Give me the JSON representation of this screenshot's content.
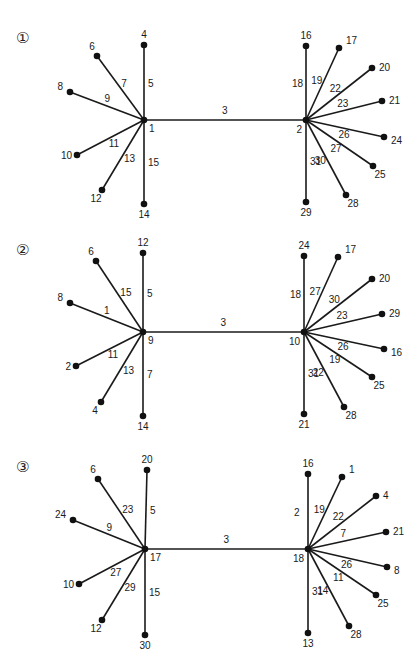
{
  "panels": [
    {
      "id": "1",
      "marker": "①",
      "hub_left": {
        "label": "1",
        "x": 144,
        "y": 120
      },
      "hub_right": {
        "label": "2",
        "x": 306,
        "y": 120
      },
      "bridge_edge": "3",
      "left_spokes": [
        {
          "node": "4",
          "edge": "5",
          "x": 144,
          "y": 45
        },
        {
          "node": "6",
          "edge": "7",
          "x": 97,
          "y": 56
        },
        {
          "node": "8",
          "edge": "9",
          "x": 70,
          "y": 92
        },
        {
          "node": "10",
          "edge": "11",
          "x": 77,
          "y": 155
        },
        {
          "node": "12",
          "edge": "13",
          "x": 102,
          "y": 190
        },
        {
          "node": "14",
          "edge": "15",
          "x": 144,
          "y": 204
        }
      ],
      "right_spokes": [
        {
          "node": "16",
          "edge": "18",
          "x": 306,
          "y": 46
        },
        {
          "node": "17",
          "edge": "19",
          "x": 339,
          "y": 48
        },
        {
          "node": "20",
          "edge": "22",
          "x": 372,
          "y": 68
        },
        {
          "node": "21",
          "edge": "23",
          "x": 382,
          "y": 101
        },
        {
          "node": "24",
          "edge": "26",
          "x": 384,
          "y": 137
        },
        {
          "node": "25",
          "edge": "27",
          "x": 373,
          "y": 166
        },
        {
          "node": "28",
          "edge": "30",
          "x": 346,
          "y": 195
        },
        {
          "node": "29",
          "edge": "31",
          "x": 306,
          "y": 202
        }
      ]
    },
    {
      "id": "2",
      "marker": "②",
      "hub_left": {
        "label": "9",
        "x": 143,
        "y": 332
      },
      "hub_right": {
        "label": "10",
        "x": 304,
        "y": 332
      },
      "bridge_edge": "3",
      "left_spokes": [
        {
          "node": "12",
          "edge": "5",
          "x": 143,
          "y": 253
        },
        {
          "node": "6",
          "edge": "15",
          "x": 96,
          "y": 261
        },
        {
          "node": "8",
          "edge": "1",
          "x": 70,
          "y": 303
        },
        {
          "node": "2",
          "edge": "11",
          "x": 76,
          "y": 366
        },
        {
          "node": "4",
          "edge": "13",
          "x": 101,
          "y": 402
        },
        {
          "node": "14",
          "edge": "7",
          "x": 143,
          "y": 416
        }
      ],
      "right_spokes": [
        {
          "node": "24",
          "edge": "18",
          "x": 304,
          "y": 256
        },
        {
          "node": "17",
          "edge": "27",
          "x": 338,
          "y": 257
        },
        {
          "node": "20",
          "edge": "30",
          "x": 372,
          "y": 279
        },
        {
          "node": "29",
          "edge": "23",
          "x": 382,
          "y": 314
        },
        {
          "node": "16",
          "edge": "26",
          "x": 384,
          "y": 349
        },
        {
          "node": "25",
          "edge": "19",
          "x": 372,
          "y": 377
        },
        {
          "node": "28",
          "edge": "22",
          "x": 344,
          "y": 407
        },
        {
          "node": "21",
          "edge": "31",
          "x": 304,
          "y": 414
        }
      ]
    },
    {
      "id": "3",
      "marker": "③",
      "hub_left": {
        "label": "17",
        "x": 145,
        "y": 549
      },
      "hub_right": {
        "label": "18",
        "x": 308,
        "y": 549
      },
      "bridge_edge": "3",
      "left_spokes": [
        {
          "node": "20",
          "edge": "5",
          "x": 147,
          "y": 470
        },
        {
          "node": "6",
          "edge": "23",
          "x": 98,
          "y": 479
        },
        {
          "node": "24",
          "edge": "9",
          "x": 73,
          "y": 520
        },
        {
          "node": "10",
          "edge": "27",
          "x": 79,
          "y": 584
        },
        {
          "node": "12",
          "edge": "29",
          "x": 102,
          "y": 620
        },
        {
          "node": "30",
          "edge": "15",
          "x": 145,
          "y": 635
        }
      ],
      "right_spokes": [
        {
          "node": "16",
          "edge": "2",
          "x": 308,
          "y": 474
        },
        {
          "node": "1",
          "edge": "19",
          "x": 342,
          "y": 477
        },
        {
          "node": "4",
          "edge": "22",
          "x": 376,
          "y": 496
        },
        {
          "node": "21",
          "edge": "7",
          "x": 386,
          "y": 532
        },
        {
          "node": "8",
          "edge": "26",
          "x": 387,
          "y": 567
        },
        {
          "node": "25",
          "edge": "11",
          "x": 376,
          "y": 595
        },
        {
          "node": "28",
          "edge": "14",
          "x": 349,
          "y": 626
        },
        {
          "node": "13",
          "edge": "31",
          "x": 308,
          "y": 633
        }
      ]
    }
  ]
}
